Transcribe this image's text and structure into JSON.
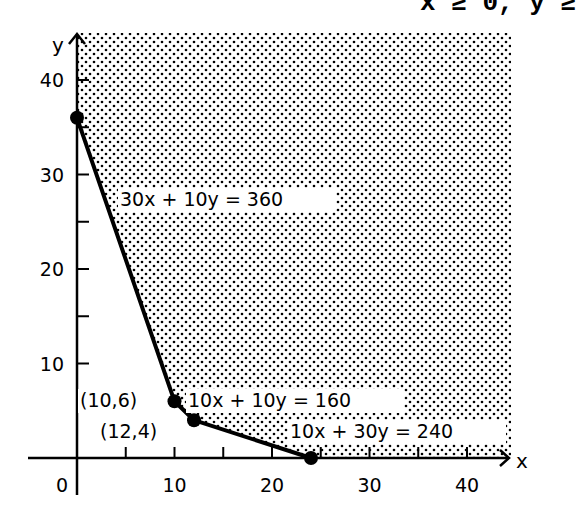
{
  "header_fragment": "x ≥ 0, y ≥",
  "chart_data": {
    "type": "line",
    "title": "",
    "xlabel": "x",
    "ylabel": "y",
    "xlim": [
      0,
      44
    ],
    "ylim": [
      0,
      44
    ],
    "x_ticks": [
      10,
      20,
      30,
      40
    ],
    "x_tick_labels": [
      "10",
      "20",
      "30",
      "40"
    ],
    "y_ticks": [
      10,
      20,
      30,
      40
    ],
    "y_tick_labels": [
      "10",
      "20",
      "30",
      "40"
    ],
    "origin_label": "0",
    "minor_tick_step": 5,
    "grid": false,
    "series": [
      {
        "name": "feasible region boundary",
        "points": [
          [
            0,
            36
          ],
          [
            10,
            6
          ],
          [
            12,
            4
          ],
          [
            24,
            0
          ]
        ]
      }
    ],
    "vertices": [
      {
        "x": 0,
        "y": 36,
        "label": ""
      },
      {
        "x": 10,
        "y": 6,
        "label": "(10,6)"
      },
      {
        "x": 12,
        "y": 4,
        "label": "(12,4)"
      },
      {
        "x": 24,
        "y": 0,
        "label": ""
      }
    ],
    "constraint_labels": [
      "30x + 10y = 360",
      "10x + 10y = 160",
      "10x + 30y = 240"
    ],
    "shaded_region": "unbounded feasible region above boundary (dotted)"
  }
}
